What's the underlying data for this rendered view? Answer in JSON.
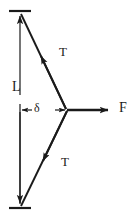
{
  "figure": {
    "kind": "free-body-diagram",
    "background_color": "#ffffff",
    "stroke_color": "#1a1a1a",
    "text_color": "#1a1a1a",
    "width_px": 136,
    "height_px": 219
  },
  "labels": {
    "length": "L",
    "force": "F",
    "tension_upper": "T",
    "tension_lower": "T",
    "deflection": "δ"
  },
  "geometry": {
    "top_support_y": 11,
    "bottom_support_y": 208,
    "support_x_left": 10,
    "support_x_right": 30,
    "wire_anchor_x": 20,
    "vertex_x": 67,
    "vertex_y": 110,
    "force_arrow_end_x": 117,
    "dimension_line_x": 20,
    "dimension_top_y": 104,
    "dimension_bottom_y": 118
  },
  "annotations": [
    {
      "name": "length-label",
      "text": "L",
      "meaning": "half-length of wire span"
    },
    {
      "name": "deflection-label",
      "text": "δ",
      "meaning": "lateral deflection at midpoint"
    },
    {
      "name": "tension-upper-label",
      "text": "T",
      "meaning": "tension in upper wire segment"
    },
    {
      "name": "tension-lower-label",
      "text": "T",
      "meaning": "tension in lower wire segment"
    },
    {
      "name": "force-label",
      "text": "F",
      "meaning": "applied transverse force"
    }
  ]
}
